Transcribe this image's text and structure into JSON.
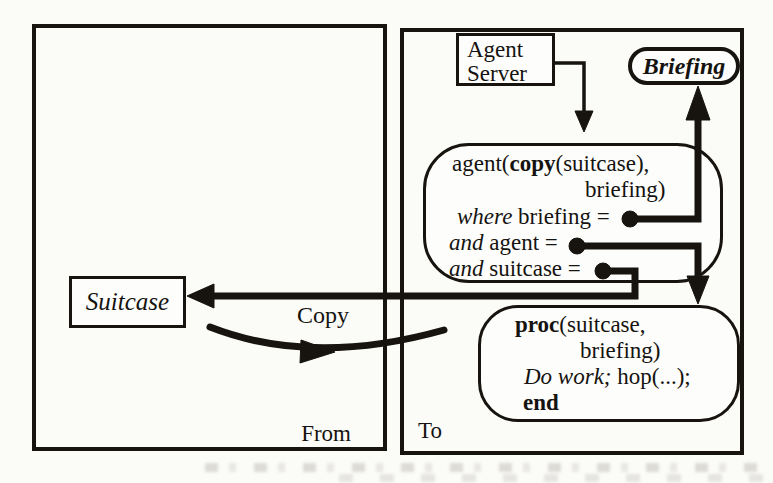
{
  "figure": {
    "description_colors": {
      "ink": "#17140f",
      "paper": "#fbfbf8"
    },
    "panels": {
      "from": {
        "label": "From"
      },
      "to": {
        "label": "To"
      }
    },
    "agent_server": {
      "line1": "Agent",
      "line2": "Server"
    },
    "briefing_node": {
      "label": "Briefing"
    },
    "suitcase_node": {
      "label": "Suitcase"
    },
    "copy_arrow": {
      "label": "Copy"
    },
    "agent_call": {
      "l1_pre": "agent(",
      "l1_bold": "copy",
      "l1_post": "(suitcase),",
      "l2": "briefing)",
      "l3_italic": "where",
      "l3_rest": " briefing =",
      "l4_italic": "and",
      "l4_rest": " agent = ",
      "l5_italic": "and",
      "l5_rest": " suitcase ="
    },
    "proc": {
      "l1_bold": "proc",
      "l1_rest": "(suitcase,",
      "l2": "briefing)",
      "l3_italic": "Do work;",
      "l3_rest": " hop(...);",
      "l4_bold": "end"
    }
  }
}
